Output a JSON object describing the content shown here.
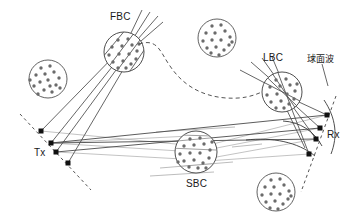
{
  "figure": {
    "background_color": "#ffffff",
    "width": 357,
    "height": 222
  },
  "colors": {
    "ray_dark": "#4a4a4a",
    "ray_light": "#b4b4b4",
    "cluster_outline": "#3a3a3a",
    "scatterer": "#6b6b6b",
    "antenna_marker": "#111111",
    "dashed_path": "#555555",
    "text": "#1a1a1a",
    "wavefront": "#3a3a3a"
  },
  "labels": [
    {
      "id": "fbc",
      "text": "FBC",
      "x": 110,
      "y": 11,
      "kind": "latin"
    },
    {
      "id": "lbc",
      "text": "LBC",
      "x": 263,
      "y": 52,
      "kind": "latin"
    },
    {
      "id": "sbc",
      "text": "SBC",
      "x": 186,
      "y": 178,
      "kind": "latin"
    },
    {
      "id": "tx",
      "text": "Tx",
      "x": 34,
      "y": 147,
      "kind": "latin"
    },
    {
      "id": "rx",
      "text": "Rx",
      "x": 327,
      "y": 129,
      "kind": "latin"
    },
    {
      "id": "wave",
      "text": "球面波",
      "x": 307,
      "y": 52,
      "kind": "cjk"
    }
  ],
  "antenna_arrays": {
    "tx": {
      "name": "Tx",
      "elements": [
        {
          "x": 41,
          "y": 131
        },
        {
          "x": 51,
          "y": 143
        },
        {
          "x": 56,
          "y": 152
        },
        {
          "x": 68,
          "y": 163
        }
      ],
      "axis_start": {
        "x": 20,
        "y": 114
      },
      "axis_end": {
        "x": 91,
        "y": 190
      }
    },
    "rx": {
      "name": "Rx",
      "elements": [
        {
          "x": 327,
          "y": 115
        },
        {
          "x": 320,
          "y": 128
        },
        {
          "x": 316,
          "y": 139
        },
        {
          "x": 309,
          "y": 154
        }
      ],
      "axis_start": {
        "x": 334,
        "y": 100
      },
      "axis_end": {
        "x": 302,
        "y": 190
      }
    }
  },
  "clusters": [
    {
      "id": "fbc",
      "label": "FBC",
      "cx": 124,
      "cy": 52,
      "r": 20,
      "labeled": true,
      "n_scatterers": 16
    },
    {
      "id": "lbc",
      "label": "LBC",
      "cx": 282,
      "cy": 92,
      "r": 20,
      "labeled": true,
      "n_scatterers": 16
    },
    {
      "id": "sbc",
      "label": "SBC",
      "cx": 196,
      "cy": 152,
      "r": 21,
      "labeled": true,
      "n_scatterers": 18
    },
    {
      "id": "c-left",
      "label": "",
      "cx": 48,
      "cy": 79,
      "r": 19,
      "labeled": false,
      "n_scatterers": 16
    },
    {
      "id": "c-topmid",
      "label": "",
      "cx": 217,
      "cy": 38,
      "r": 19,
      "labeled": false,
      "n_scatterers": 16
    },
    {
      "id": "c-botrght",
      "label": "",
      "cx": 276,
      "cy": 192,
      "r": 19,
      "labeled": false,
      "n_scatterers": 16
    }
  ],
  "paths": {
    "dashed_nlos_curve": {
      "description": "dashed multi-bounce path from FBC to LBC",
      "from": "fbc",
      "to": "lbc"
    },
    "spherical_wavefronts": {
      "description": "curved arcs near Rx indicating spherical wavefronts",
      "count": 3
    },
    "ray_bundles": [
      {
        "from": "tx",
        "to": "fbc",
        "style": "dark",
        "count": 4
      },
      {
        "from": "fbc",
        "to": "upper-escape",
        "style": "dark",
        "count": 4
      },
      {
        "from": "lbc",
        "to": "rx",
        "style": "dark",
        "count": 4
      },
      {
        "from": "upper-entry",
        "to": "lbc",
        "style": "dark",
        "count": 4
      },
      {
        "from": "tx",
        "to": "rx",
        "style": "dark",
        "count": 2
      },
      {
        "from": "tx",
        "to": "sbc",
        "style": "light",
        "count": 3
      },
      {
        "from": "sbc",
        "to": "rx",
        "style": "light",
        "count": 3
      }
    ]
  }
}
